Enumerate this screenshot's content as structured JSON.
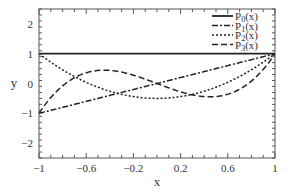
{
  "chart_data": {
    "type": "line",
    "title": "",
    "xlabel": "x",
    "ylabel": "y",
    "xlim": [
      -1,
      1
    ],
    "ylim": [
      -2.5,
      2.5
    ],
    "grid": false,
    "legend_position": "upper right",
    "x_ticks": [
      "-1",
      "-0.6",
      "-0.2",
      "0.2",
      "0.6",
      "1"
    ],
    "y_ticks": [
      "-2",
      "-1",
      "0",
      "1",
      "2"
    ],
    "series": [
      {
        "name": "P0(x)",
        "label_main": "P",
        "label_sub": "0",
        "label_tail": "(x)",
        "style": "solid",
        "formula": "1"
      },
      {
        "name": "P1(x)",
        "label_main": "P",
        "label_sub": "1",
        "label_tail": "(x)",
        "style": "dash-dot",
        "formula": "x"
      },
      {
        "name": "P2(x)",
        "label_main": "P",
        "label_sub": "2",
        "label_tail": "(x)",
        "style": "dotted",
        "formula": "(3x^2-1)/2"
      },
      {
        "name": "P3(x)",
        "label_main": "P",
        "label_sub": "3",
        "label_tail": "(x)",
        "style": "dashed",
        "formula": "(5x^3-3x)/2"
      }
    ],
    "x": [
      -1,
      -0.8,
      -0.6,
      -0.4,
      -0.2,
      0,
      0.2,
      0.4,
      0.6,
      0.8,
      1
    ],
    "values": {
      "P0(x)": [
        1,
        1,
        1,
        1,
        1,
        1,
        1,
        1,
        1,
        1,
        1
      ],
      "P1(x)": [
        -1,
        -0.8,
        -0.6,
        -0.4,
        -0.2,
        0,
        0.2,
        0.4,
        0.6,
        0.8,
        1
      ],
      "P2(x)": [
        1,
        0.46,
        0.04,
        -0.26,
        -0.44,
        -0.5,
        -0.44,
        -0.26,
        0.04,
        0.46,
        1
      ],
      "P3(x)": [
        -1,
        -0.08,
        0.36,
        0.44,
        0.28,
        0,
        -0.28,
        -0.44,
        -0.36,
        0.08,
        1
      ]
    },
    "colors": {
      "line": "#222222",
      "axis": "#555555",
      "text": "#333333"
    }
  }
}
